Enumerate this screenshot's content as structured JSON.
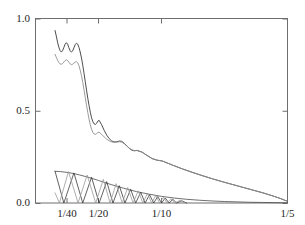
{
  "figure": {
    "background_color": "#ffffff",
    "frame_color": "#6e6e6e"
  },
  "chart_data": {
    "type": "line",
    "title": "",
    "subtitle": "",
    "xlabel": "",
    "ylabel": "",
    "grid": false,
    "legend": null,
    "legend_position": "none",
    "xlim": [
      0.0,
      0.2
    ],
    "ylim": [
      0.0,
      1.0
    ],
    "x_tick_labels": [
      "1/40",
      "1/20",
      "1/10",
      "1/5"
    ],
    "x_tick_values": [
      0.025,
      0.05,
      0.1,
      0.2
    ],
    "y_tick_labels": [
      "0.0",
      "0.5",
      "1.0"
    ],
    "y_tick_values": [
      0.0,
      0.5,
      1.0
    ],
    "x_axis_note": "axis is linear in step size h; ticks labelled as reciprocals 1/40, 1/20, 1/10, 1/5",
    "series": [
      {
        "name": "upper-dark-curve",
        "color": "#3a3a3a",
        "width": 0.9,
        "x": [
          0.0155,
          0.0165,
          0.0175,
          0.0185,
          0.0195,
          0.0205,
          0.0215,
          0.0225,
          0.0235,
          0.0245,
          0.0255,
          0.0265,
          0.0275,
          0.0285,
          0.0295,
          0.0305,
          0.0315,
          0.0325,
          0.0335,
          0.0345,
          0.0355,
          0.0365,
          0.0375,
          0.0385,
          0.0395,
          0.0405,
          0.0415,
          0.0425,
          0.0435,
          0.0445,
          0.0455,
          0.0465,
          0.0475,
          0.0485,
          0.0495,
          0.0505,
          0.0525,
          0.0545,
          0.0565,
          0.0585,
          0.0605,
          0.0625,
          0.0645,
          0.0665,
          0.0685,
          0.0705,
          0.0725,
          0.0745,
          0.0765,
          0.0785,
          0.0805,
          0.0845,
          0.0885,
          0.0925,
          0.0965,
          0.1005,
          0.1085,
          0.1165,
          0.1245,
          0.1325,
          0.1405,
          0.1485,
          0.1565,
          0.1645,
          0.1725,
          0.1805,
          0.1885,
          0.1945,
          0.2
        ],
        "y": [
          0.935,
          0.905,
          0.872,
          0.845,
          0.826,
          0.818,
          0.826,
          0.843,
          0.861,
          0.869,
          0.861,
          0.842,
          0.825,
          0.818,
          0.824,
          0.841,
          0.858,
          0.866,
          0.861,
          0.843,
          0.818,
          0.786,
          0.747,
          0.703,
          0.658,
          0.612,
          0.568,
          0.528,
          0.492,
          0.462,
          0.441,
          0.429,
          0.426,
          0.432,
          0.444,
          0.448,
          0.424,
          0.394,
          0.368,
          0.349,
          0.336,
          0.331,
          0.332,
          0.336,
          0.334,
          0.323,
          0.309,
          0.296,
          0.286,
          0.283,
          0.285,
          0.276,
          0.258,
          0.241,
          0.232,
          0.228,
          0.206,
          0.185,
          0.166,
          0.148,
          0.131,
          0.115,
          0.1,
          0.085,
          0.07,
          0.055,
          0.038,
          0.024,
          0.009
        ]
      },
      {
        "name": "upper-light-curve",
        "color": "#8e8e8e",
        "width": 0.9,
        "x": [
          0.0155,
          0.0165,
          0.0175,
          0.0185,
          0.0195,
          0.0205,
          0.0215,
          0.0225,
          0.0235,
          0.0245,
          0.0255,
          0.0265,
          0.0275,
          0.0285,
          0.0295,
          0.0305,
          0.0315,
          0.0325,
          0.0335,
          0.0345,
          0.0355,
          0.0365,
          0.0375,
          0.0385,
          0.0395,
          0.0405,
          0.0415,
          0.0425,
          0.0435,
          0.0445,
          0.0455,
          0.0465,
          0.0475,
          0.0485,
          0.0495,
          0.0505,
          0.0525,
          0.0545,
          0.0565,
          0.0585,
          0.0605,
          0.0625,
          0.0645,
          0.0665,
          0.0685,
          0.0705,
          0.0725,
          0.0745,
          0.0765,
          0.0785,
          0.0805,
          0.0845,
          0.0885,
          0.0925,
          0.0965,
          0.1005,
          0.1085,
          0.1165,
          0.1245,
          0.1325,
          0.1405,
          0.1485,
          0.1565,
          0.1645,
          0.1725,
          0.1805,
          0.1885,
          0.1945,
          0.2
        ],
        "y": [
          0.806,
          0.79,
          0.774,
          0.762,
          0.754,
          0.752,
          0.756,
          0.764,
          0.772,
          0.776,
          0.772,
          0.763,
          0.754,
          0.75,
          0.752,
          0.758,
          0.764,
          0.766,
          0.76,
          0.744,
          0.72,
          0.69,
          0.654,
          0.614,
          0.572,
          0.53,
          0.49,
          0.455,
          0.424,
          0.4,
          0.383,
          0.374,
          0.372,
          0.376,
          0.382,
          0.384,
          0.372,
          0.358,
          0.346,
          0.337,
          0.331,
          0.329,
          0.33,
          0.332,
          0.33,
          0.321,
          0.309,
          0.297,
          0.288,
          0.284,
          0.285,
          0.276,
          0.258,
          0.241,
          0.232,
          0.228,
          0.206,
          0.185,
          0.166,
          0.148,
          0.131,
          0.115,
          0.1,
          0.085,
          0.07,
          0.055,
          0.038,
          0.024,
          0.009
        ]
      },
      {
        "name": "lower-envelope-curve",
        "color": "#4a4a4a",
        "width": 0.8,
        "x": [
          0.0155,
          0.02,
          0.025,
          0.03,
          0.035,
          0.04,
          0.045,
          0.05,
          0.055,
          0.06,
          0.065,
          0.07,
          0.075,
          0.08,
          0.085,
          0.09,
          0.095,
          0.1,
          0.11,
          0.12,
          0.13,
          0.14,
          0.15,
          0.16,
          0.17,
          0.18,
          0.19,
          0.2
        ],
        "y": [
          0.172,
          0.17,
          0.166,
          0.16,
          0.152,
          0.143,
          0.133,
          0.122,
          0.111,
          0.1,
          0.09,
          0.08,
          0.071,
          0.062,
          0.055,
          0.048,
          0.042,
          0.036,
          0.027,
          0.02,
          0.015,
          0.011,
          0.008,
          0.006,
          0.004,
          0.003,
          0.002,
          0.001
        ]
      },
      {
        "name": "lower-sawtooth-dark",
        "color": "#3a3a3a",
        "width": 0.8,
        "x": [
          0.0155,
          0.0225,
          0.0305,
          0.0375,
          0.0445,
          0.0505,
          0.0565,
          0.0615,
          0.0665,
          0.071,
          0.0755,
          0.0795,
          0.0835,
          0.087,
          0.0905,
          0.0938,
          0.097,
          0.1,
          0.103,
          0.106,
          0.109,
          0.112,
          0.116,
          0.12
        ],
        "y": [
          0.172,
          0.0,
          0.163,
          0.0,
          0.14,
          0.0,
          0.116,
          0.0,
          0.094,
          0.0,
          0.074,
          0.0,
          0.058,
          0.0,
          0.045,
          0.0,
          0.035,
          0.0,
          0.027,
          0.0,
          0.02,
          0.0,
          0.012,
          0.0
        ]
      },
      {
        "name": "lower-sawtooth-light",
        "color": "#9a9a9a",
        "width": 0.8,
        "x": [
          0.0155,
          0.019,
          0.0262,
          0.0338,
          0.041,
          0.0478,
          0.0538,
          0.0592,
          0.064,
          0.0688,
          0.0732,
          0.0775,
          0.0815,
          0.0852,
          0.0888,
          0.0922,
          0.0954,
          0.0985,
          0.1015,
          0.1045,
          0.1075,
          0.1105,
          0.1145,
          0.119
        ],
        "y": [
          0.055,
          0.0,
          0.17,
          0.0,
          0.152,
          0.0,
          0.128,
          0.0,
          0.105,
          0.0,
          0.084,
          0.0,
          0.066,
          0.0,
          0.051,
          0.0,
          0.04,
          0.0,
          0.031,
          0.0,
          0.023,
          0.0,
          0.014,
          0.0
        ]
      }
    ]
  },
  "axes": {
    "y_labels": [
      {
        "text": "1.0",
        "value": 1.0
      },
      {
        "text": "0.5",
        "value": 0.5
      },
      {
        "text": "0.0",
        "value": 0.0
      }
    ],
    "x_labels": [
      {
        "text": "1/40",
        "value": 0.025
      },
      {
        "text": "1/20",
        "value": 0.05
      },
      {
        "text": "1/10",
        "value": 0.1
      },
      {
        "text": "1/5",
        "value": 0.2
      }
    ]
  }
}
